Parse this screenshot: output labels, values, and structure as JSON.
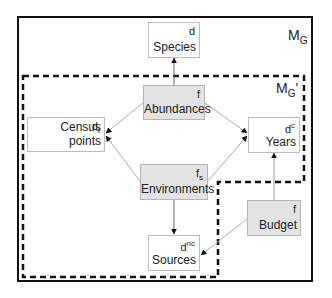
{
  "diagram": {
    "outer_model_label": "M",
    "outer_model_sub": "G",
    "inner_model_label": "M",
    "inner_model_sub": "G",
    "inner_model_prime": "'",
    "nodes": {
      "species": {
        "label": "Species",
        "tag": "d",
        "tag_sub": "",
        "tag_sup": "",
        "shaded": false
      },
      "abundances": {
        "label": "Abundances",
        "tag": "f",
        "tag_sub": "",
        "tag_sup": "",
        "shaded": true
      },
      "census_points": {
        "label": "Census points",
        "tag": "d",
        "tag_sub": "t",
        "tag_sup": "",
        "shaded": false
      },
      "years": {
        "label": "Years",
        "tag": "d",
        "tag_sub": "",
        "tag_sup": "c",
        "shaded": false
      },
      "environments": {
        "label": "Environments",
        "tag": "f",
        "tag_sub": "s",
        "tag_sup": "",
        "shaded": true
      },
      "budget": {
        "label": "Budget",
        "tag": "f",
        "tag_sub": "",
        "tag_sup": "",
        "shaded": true
      },
      "sources": {
        "label": "Sources",
        "tag": "d",
        "tag_sub": "",
        "tag_sup": "nc",
        "shaded": false
      }
    },
    "edges": [
      {
        "from": "abundances",
        "to": "species",
        "style": "dark"
      },
      {
        "from": "abundances",
        "to": "census_points",
        "style": "light"
      },
      {
        "from": "abundances",
        "to": "years",
        "style": "light"
      },
      {
        "from": "environments",
        "to": "census_points",
        "style": "light"
      },
      {
        "from": "environments",
        "to": "years",
        "style": "light"
      },
      {
        "from": "environments",
        "to": "sources",
        "style": "dark"
      },
      {
        "from": "budget",
        "to": "years",
        "style": "dark"
      },
      {
        "from": "budget",
        "to": "sources",
        "style": "light"
      }
    ],
    "colors": {
      "frame": "#111111",
      "shaded_fill": "#e3e3e3",
      "node_border": "#bdbdbd",
      "light_edge": "#aaaaaa",
      "dark_edge": "#555555"
    }
  }
}
